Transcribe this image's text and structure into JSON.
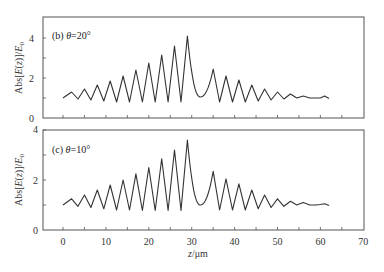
{
  "chart_data": [
    {
      "type": "line",
      "panel_label": "(b) θ=20°",
      "ylabel": "Abs[E(z)]/E0",
      "xlabel": "",
      "xlim": [
        -4.7,
        70
      ],
      "ylim": [
        0,
        5
      ],
      "yticks": [
        0,
        2,
        4
      ],
      "xticks_minor": [
        0,
        5,
        10,
        15,
        20,
        25,
        30,
        35,
        40,
        45,
        50,
        55,
        60,
        65
      ],
      "grid": false,
      "series": [
        {
          "name": "θ=20°",
          "x": [
            0,
            2,
            3.5,
            5,
            6.5,
            8,
            9.5,
            11,
            12.5,
            14,
            15.5,
            17,
            18.5,
            20,
            21.5,
            23,
            24.5,
            26,
            27.5,
            29,
            32,
            35,
            36.5,
            38,
            39.5,
            41,
            42.5,
            44,
            45.5,
            47,
            48.5,
            50,
            51.5,
            53,
            54.5,
            56,
            57.5,
            59,
            60,
            61,
            62
          ],
          "y": [
            1.0,
            1.3,
            0.95,
            1.45,
            0.9,
            1.65,
            0.85,
            1.85,
            0.8,
            2.1,
            0.8,
            2.4,
            0.8,
            2.75,
            0.8,
            3.15,
            0.8,
            3.6,
            0.8,
            4.1,
            1.05,
            2.45,
            0.8,
            2.1,
            0.8,
            1.9,
            0.8,
            1.65,
            0.85,
            1.45,
            0.9,
            1.3,
            0.95,
            1.2,
            1.0,
            1.1,
            1.0,
            1.0,
            1.0,
            1.1,
            0.98
          ]
        }
      ]
    },
    {
      "type": "line",
      "panel_label": "(c) θ=10°",
      "ylabel": "Abs[E(z)]/E0",
      "xlabel": "z/μm",
      "xlim": [
        -4.7,
        70
      ],
      "ylim": [
        0,
        4
      ],
      "yticks": [
        0,
        2,
        4
      ],
      "xticks": [
        0,
        10,
        20,
        30,
        40,
        50,
        60,
        70
      ],
      "grid": false,
      "series": [
        {
          "name": "θ=10°",
          "x": [
            0,
            2,
            3.5,
            5,
            6.5,
            8,
            9.5,
            11,
            12.5,
            14,
            15.5,
            17,
            18.5,
            20,
            21.5,
            23,
            24.5,
            26,
            27.5,
            29,
            32,
            35,
            36.5,
            38,
            39.5,
            41,
            42.5,
            44,
            45.5,
            47,
            48.5,
            50,
            51.5,
            53,
            54.5,
            56,
            57.5,
            59,
            60,
            61,
            62
          ],
          "y": [
            1.0,
            1.25,
            0.95,
            1.4,
            0.9,
            1.6,
            0.85,
            1.8,
            0.8,
            2.0,
            0.8,
            2.25,
            0.78,
            2.5,
            0.78,
            2.85,
            0.78,
            3.2,
            0.78,
            3.6,
            1.0,
            2.35,
            0.8,
            2.05,
            0.8,
            1.85,
            0.8,
            1.6,
            0.85,
            1.4,
            0.9,
            1.25,
            0.95,
            1.15,
            1.0,
            1.1,
            1.0,
            1.0,
            1.02,
            1.05,
            0.98
          ]
        }
      ]
    }
  ],
  "labels": {
    "top_panel": "(b) θ=20°",
    "bottom_panel": "(c) θ=10°",
    "ylabel": "Abs[E(z)]/E0",
    "xlabel": "z/μm",
    "top_yticks": [
      "0",
      "2",
      "4"
    ],
    "bottom_yticks": [
      "0",
      "2",
      "4"
    ],
    "bottom_xticks": [
      "0",
      "10",
      "20",
      "30",
      "40",
      "50",
      "60",
      "70"
    ]
  }
}
